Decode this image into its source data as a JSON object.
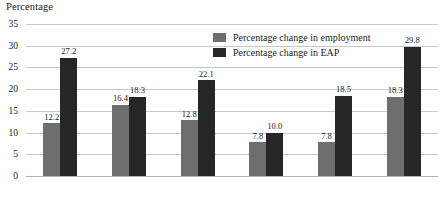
{
  "chart_data": {
    "type": "bar",
    "title": "",
    "ylabel": "Percentage",
    "xlabel": "",
    "categories": [
      "African",
      "Coloured",
      "Indian",
      "White",
      "Male",
      "Female"
    ],
    "series": [
      {
        "name": "Percentage change in employment",
        "color": "#6e6e6e",
        "values": [
          12.2,
          16.4,
          12.8,
          7.8,
          7.8,
          18.3
        ],
        "labels": [
          "12.2",
          "16.4",
          "12.8",
          "7.8",
          "7.8",
          "18.3"
        ]
      },
      {
        "name": "Percentage change in EAP",
        "color": "#262626",
        "values": [
          27.2,
          18.3,
          22.1,
          10.0,
          18.5,
          29.8
        ],
        "labels": [
          "27.2",
          "18.3",
          "22.1",
          "10.0",
          "18.5",
          "29.8"
        ]
      }
    ],
    "ylim": [
      0,
      35
    ],
    "yticks": [
      0,
      5,
      10,
      15,
      20,
      25,
      30,
      35
    ],
    "ytick_labels": [
      "0",
      "5",
      "10",
      "15",
      "20",
      "25",
      "30",
      "35"
    ],
    "grid": true,
    "legend_position": "top-center"
  },
  "legend": {
    "items": [
      {
        "label": "Percentage change in employment"
      },
      {
        "label": "Percentage change in EAP"
      }
    ]
  }
}
